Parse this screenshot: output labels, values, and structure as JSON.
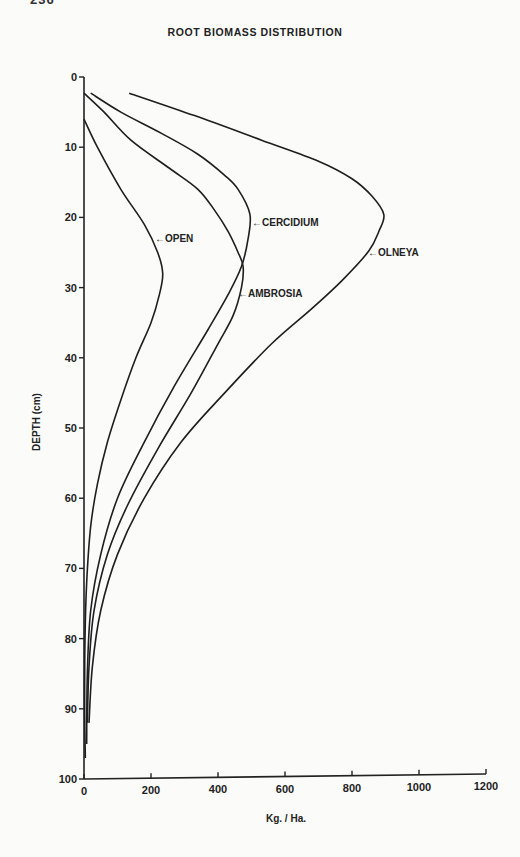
{
  "page": {
    "page_number_fragment": "236"
  },
  "chart_data": {
    "type": "line",
    "title": "ROOT BIOMASS DISTRIBUTION",
    "xlabel": "Kg. / Ha.",
    "ylabel": "DEPTH (cm)",
    "xlim": [
      0,
      1200
    ],
    "ylim": [
      0,
      100
    ],
    "y_inverted": true,
    "grid": false,
    "legend": "inline labels with arrows",
    "x_ticks": [
      0,
      200,
      400,
      600,
      800,
      1000,
      1200
    ],
    "y_ticks": [
      0,
      10,
      20,
      30,
      40,
      50,
      60,
      70,
      80,
      90,
      100
    ],
    "series": [
      {
        "name": "OPEN",
        "label_depth": 23.5,
        "points": [
          [
            0,
            6
          ],
          [
            40,
            10
          ],
          [
            110,
            16
          ],
          [
            180,
            21
          ],
          [
            220,
            25
          ],
          [
            235,
            28
          ],
          [
            225,
            31
          ],
          [
            200,
            35
          ],
          [
            155,
            40
          ],
          [
            110,
            46
          ],
          [
            70,
            52
          ],
          [
            40,
            58
          ],
          [
            20,
            64
          ],
          [
            8,
            72
          ],
          [
            3,
            80
          ],
          [
            2,
            90
          ],
          [
            4,
            97
          ]
        ]
      },
      {
        "name": "CERCIDIUM",
        "label_depth": 20.5,
        "points": [
          [
            20,
            2.3
          ],
          [
            110,
            5
          ],
          [
            230,
            8
          ],
          [
            340,
            11
          ],
          [
            420,
            14
          ],
          [
            460,
            16
          ],
          [
            495,
            19.5
          ],
          [
            490,
            23
          ],
          [
            470,
            27
          ],
          [
            430,
            31
          ],
          [
            370,
            36
          ],
          [
            270,
            44
          ],
          [
            180,
            52
          ],
          [
            100,
            60
          ],
          [
            50,
            68
          ],
          [
            20,
            76
          ],
          [
            10,
            85
          ],
          [
            8,
            95
          ]
        ]
      },
      {
        "name": "AMBROSIA",
        "label_depth": 30.5,
        "points": [
          [
            0,
            2.3
          ],
          [
            60,
            5
          ],
          [
            140,
            9
          ],
          [
            255,
            13
          ],
          [
            340,
            16
          ],
          [
            390,
            19
          ],
          [
            430,
            22
          ],
          [
            460,
            25
          ],
          [
            475,
            27
          ],
          [
            470,
            30
          ],
          [
            445,
            34
          ],
          [
            400,
            38
          ],
          [
            320,
            45
          ],
          [
            220,
            53
          ],
          [
            130,
            61
          ],
          [
            70,
            68
          ],
          [
            30,
            76
          ],
          [
            15,
            84
          ],
          [
            10,
            92
          ]
        ]
      },
      {
        "name": "OLNEYA",
        "label_depth": 24.8,
        "points": [
          [
            135,
            2.3
          ],
          [
            330,
            5.5
          ],
          [
            530,
            9
          ],
          [
            700,
            12
          ],
          [
            800,
            14.5
          ],
          [
            860,
            17
          ],
          [
            895,
            19.6
          ],
          [
            880,
            22
          ],
          [
            850,
            24.8
          ],
          [
            770,
            29
          ],
          [
            680,
            33
          ],
          [
            560,
            38
          ],
          [
            420,
            45
          ],
          [
            290,
            52
          ],
          [
            180,
            60
          ],
          [
            100,
            68
          ],
          [
            50,
            76
          ],
          [
            25,
            84
          ],
          [
            15,
            92
          ]
        ]
      }
    ],
    "annotations": [
      {
        "text": "OPEN",
        "arrow_to_series": "OPEN"
      },
      {
        "text": "CERCIDIUM",
        "arrow_to_series": "CERCIDIUM"
      },
      {
        "text": "AMBROSIA",
        "arrow_to_series": "AMBROSIA"
      },
      {
        "text": "OLNEYA",
        "arrow_to_series": "OLNEYA"
      }
    ]
  },
  "labels": {
    "open": "←OPEN",
    "cercidium": "←CERCIDIUM",
    "ambrosia": "←AMBROSIA",
    "olneya": "←OLNEYA"
  }
}
